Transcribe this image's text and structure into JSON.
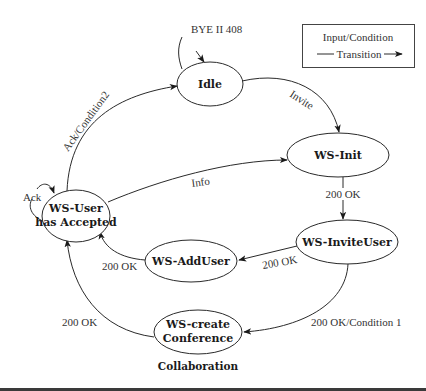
{
  "diagram": {
    "caption": "Collaboration",
    "legend": {
      "line1": "Input/Condition",
      "line2": "Transition"
    },
    "nodes": [
      {
        "id": "idle",
        "lines": [
          "Idle"
        ]
      },
      {
        "id": "ws-init",
        "lines": [
          "WS-Init"
        ]
      },
      {
        "id": "ws-inviteuser",
        "lines": [
          "WS-InviteUser"
        ]
      },
      {
        "id": "ws-adduser",
        "lines": [
          "WS-AddUser"
        ]
      },
      {
        "id": "ws-create-conference",
        "lines": [
          "WS-create",
          "Conference"
        ]
      },
      {
        "id": "ws-user-accepted",
        "lines": [
          "WS-User",
          "has Accepted"
        ]
      }
    ],
    "edges": [
      {
        "from": "external",
        "to": "idle",
        "label": "BYE II 408"
      },
      {
        "from": "idle",
        "to": "ws-init",
        "label": "Invite"
      },
      {
        "from": "ws-init",
        "to": "ws-inviteuser",
        "label": "200 OK"
      },
      {
        "from": "ws-inviteuser",
        "to": "ws-adduser",
        "label": "200 OK"
      },
      {
        "from": "ws-inviteuser",
        "to": "ws-create-conference",
        "label": "200 OK/Condition 1"
      },
      {
        "from": "ws-adduser",
        "to": "ws-user-accepted",
        "label": "200 OK"
      },
      {
        "from": "ws-create-conference",
        "to": "ws-user-accepted",
        "label": "200 OK"
      },
      {
        "from": "ws-user-accepted",
        "to": "ws-init",
        "label": "Info"
      },
      {
        "from": "ws-user-accepted",
        "to": "idle",
        "label": "Ack/Condition2"
      },
      {
        "from": "ws-user-accepted",
        "to": "ws-user-accepted",
        "label": "Ack"
      }
    ]
  }
}
